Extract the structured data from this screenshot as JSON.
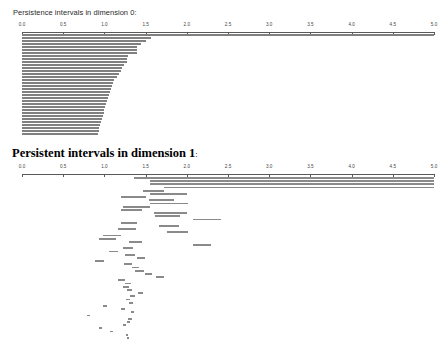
{
  "figure": {
    "background": "#ffffff",
    "bar_color": "#808080",
    "axis_color": "#5a5a5a"
  },
  "panels": [
    {
      "id": "dimension-0",
      "title": "Persistence intervals in dimension 0:",
      "title_style": "sans-regular"
    },
    {
      "id": "dimension-1",
      "title": "Persistent intervals in dimension 1",
      "title_suffix": ":",
      "title_style": "serif-bold"
    }
  ],
  "axis": {
    "ticks": [
      "0.0",
      "0.5",
      "1.0",
      "1.5",
      "2.0",
      "2.5",
      "3.0",
      "3.5",
      "4.0",
      "4.5",
      "5.0"
    ],
    "min": 0.0,
    "max": 5.0
  },
  "chart_data": [
    {
      "type": "barcode",
      "title": "Persistence intervals in dimension 0:",
      "dimension": 0,
      "xlabel": "",
      "ylabel": "",
      "xlim": [
        0.0,
        5.0
      ],
      "grid": false,
      "legend": "none",
      "xticks": [
        0.0,
        0.5,
        1.0,
        1.5,
        2.0,
        2.5,
        3.0,
        3.5,
        4.0,
        4.5,
        5.0
      ],
      "intervals": [
        [
          0.0,
          5.0
        ],
        [
          0.0,
          1.56
        ],
        [
          0.0,
          1.5
        ],
        [
          0.0,
          1.44
        ],
        [
          0.0,
          1.4
        ],
        [
          0.0,
          1.4
        ],
        [
          0.0,
          1.39
        ],
        [
          0.0,
          1.29
        ],
        [
          0.0,
          1.28
        ],
        [
          0.0,
          1.27
        ],
        [
          0.0,
          1.24
        ],
        [
          0.0,
          1.21
        ],
        [
          0.0,
          1.2
        ],
        [
          0.0,
          1.18
        ],
        [
          0.0,
          1.15
        ],
        [
          0.0,
          1.12
        ],
        [
          0.0,
          1.1
        ],
        [
          0.0,
          1.09
        ],
        [
          0.0,
          1.08
        ],
        [
          0.0,
          1.07
        ],
        [
          0.0,
          1.05
        ],
        [
          0.0,
          1.04
        ],
        [
          0.0,
          1.03
        ],
        [
          0.0,
          1.02
        ],
        [
          0.0,
          1.01
        ],
        [
          0.0,
          1.0
        ],
        [
          0.0,
          0.99
        ],
        [
          0.0,
          0.98
        ],
        [
          0.0,
          0.97
        ],
        [
          0.0,
          0.96
        ],
        [
          0.0,
          0.95
        ],
        [
          0.0,
          0.94
        ],
        [
          0.0,
          0.93
        ],
        [
          0.0,
          0.92
        ]
      ]
    },
    {
      "type": "barcode",
      "title": "Persistent intervals in dimension 1:",
      "dimension": 1,
      "xlabel": "",
      "ylabel": "",
      "xlim": [
        0.0,
        5.0
      ],
      "grid": false,
      "legend": "none",
      "xticks": [
        0.0,
        0.5,
        1.0,
        1.5,
        2.0,
        2.5,
        3.0,
        3.5,
        4.0,
        4.5,
        5.0
      ],
      "intervals": [
        [
          1.36,
          5.0
        ],
        [
          1.55,
          5.0
        ],
        [
          1.55,
          5.0
        ],
        [
          1.72,
          5.0
        ],
        [
          1.47,
          1.72
        ],
        [
          1.55,
          2.0
        ],
        [
          1.2,
          1.51
        ],
        [
          1.54,
          1.85
        ],
        [
          1.55,
          2.02
        ],
        [
          1.23,
          1.55
        ],
        [
          1.2,
          1.46
        ],
        [
          1.6,
          2.0
        ],
        [
          1.62,
          1.92
        ],
        [
          2.08,
          2.42
        ],
        [
          1.2,
          1.4
        ],
        [
          1.66,
          1.91
        ],
        [
          1.17,
          1.38
        ],
        [
          1.76,
          2.02
        ],
        [
          0.98,
          1.2
        ],
        [
          0.94,
          1.14
        ],
        [
          1.3,
          1.46
        ],
        [
          2.07,
          2.29
        ],
        [
          1.22,
          1.35
        ],
        [
          1.05,
          1.17
        ],
        [
          1.25,
          1.37
        ],
        [
          1.39,
          1.49
        ],
        [
          0.88,
          0.99
        ],
        [
          1.24,
          1.34
        ],
        [
          1.33,
          1.42
        ],
        [
          1.37,
          1.48
        ],
        [
          1.49,
          1.58
        ],
        [
          1.63,
          1.72
        ],
        [
          1.17,
          1.25
        ],
        [
          1.25,
          1.32
        ],
        [
          1.23,
          1.3
        ],
        [
          1.27,
          1.33
        ],
        [
          1.41,
          1.47
        ],
        [
          1.31,
          1.37
        ],
        [
          1.26,
          1.31
        ],
        [
          1.3,
          1.35
        ],
        [
          0.98,
          1.03
        ],
        [
          1.2,
          1.25
        ],
        [
          1.32,
          1.36
        ],
        [
          0.79,
          0.83
        ],
        [
          1.29,
          1.33
        ],
        [
          1.27,
          1.31
        ],
        [
          1.22,
          1.26
        ],
        [
          0.94,
          0.97
        ],
        [
          1.07,
          1.1
        ],
        [
          1.26,
          1.29
        ],
        [
          1.28,
          1.3
        ]
      ]
    }
  ]
}
